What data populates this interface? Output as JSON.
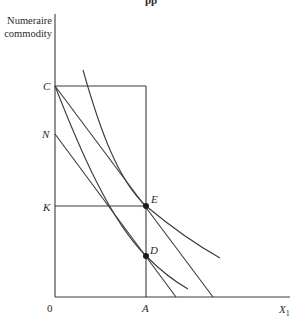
{
  "header": {
    "partial_title": "pp"
  },
  "axes": {
    "y_label_line1": "Numeraire",
    "y_label_line2": "commodity",
    "x_label": "X",
    "x_label_sub": "1",
    "origin": "0"
  },
  "points": {
    "C": "C",
    "N": "N",
    "K": "K",
    "A": "A",
    "E": "E",
    "D": "D"
  },
  "colors": {
    "line": "#3a3a3a",
    "text": "#2a2a2a",
    "background": "#ffffff"
  }
}
